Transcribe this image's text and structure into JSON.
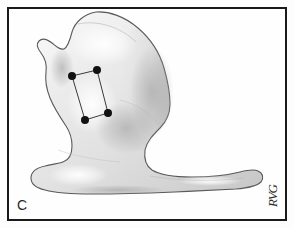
{
  "figure": {
    "panel_label": "C",
    "artist_signature": "RVG",
    "medium": "graphite pencil anatomical illustration",
    "frame_color": "#1a1a1a",
    "background_color": "#fefefe",
    "bone_fill_light": "#f2f2f2",
    "bone_fill_mid": "#dcdcdc",
    "bone_fill_dark": "#bfbfbf",
    "outline_color": "#5a5a5a",
    "marker_color": "#111111",
    "marker_line_color": "#3a3a3a"
  },
  "markers": {
    "label": "four-point rectangular landmark set",
    "count": 4,
    "radius": 4,
    "points": [
      {
        "name": "top-left",
        "x": 72,
        "y": 76
      },
      {
        "name": "top-right",
        "x": 97,
        "y": 70
      },
      {
        "name": "bottom-right",
        "x": 108,
        "y": 113
      },
      {
        "name": "bottom-left",
        "x": 85,
        "y": 120
      }
    ]
  },
  "bone_outline": {
    "path": "M 96 12 C 108 11, 124 16, 138 28 C 152 40, 160 54, 164 68 C 168 82, 170 94, 170 104 C 170 114, 166 122, 160 128 C 153 135, 147 141, 145 150 C 144 158, 146 166, 152 170 C 160 175, 175 177, 192 177 C 210 177, 228 175, 240 172 C 248 170, 254 169, 258 171 C 263 173, 264 178, 261 182 C 257 186, 248 188, 236 189 C 218 190, 196 191, 175 192 C 150 193, 118 194, 92 194 C 72 194, 56 193, 45 190 C 36 188, 31 184, 31 178 C 31 172, 36 168, 45 166 C 52 164, 58 164, 63 162 C 69 160, 72 154, 72 146 C 72 138, 70 132, 66 126 C 60 117, 54 108, 50 98 C 46 88, 45 80, 46 72 C 47 64, 45 58, 41 53 C 37 48, 36 44, 39 41 C 42 38, 47 39, 52 43 C 57 47, 60 50, 64 49 C 68 47, 70 40, 72 32 C 75 22, 84 14, 96 12 Z"
  }
}
